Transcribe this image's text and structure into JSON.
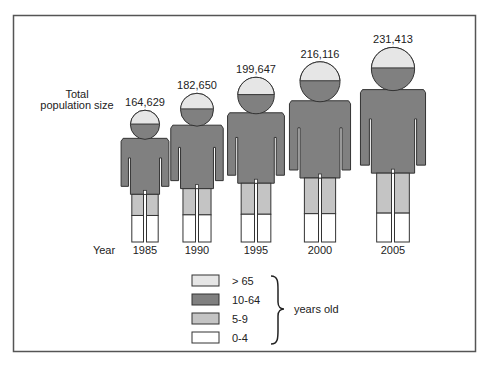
{
  "chart_data": {
    "type": "pictogram",
    "title": "",
    "population_label_line1": "Total",
    "population_label_line2": "population size",
    "year_label": "Year",
    "categories": [
      "1985",
      "1990",
      "1995",
      "2000",
      "2005"
    ],
    "totals": [
      164629,
      182650,
      199647,
      216116,
      231413
    ],
    "total_labels": [
      "164,629",
      "182,650",
      "199,647",
      "216,116",
      "231,413"
    ],
    "age_groups": [
      {
        "name": "> 65",
        "color": "#e6e6e6"
      },
      {
        "name": "10-64",
        "color": "#808080"
      },
      {
        "name": "5-9",
        "color": "#c4c4c4"
      },
      {
        "name": "0-4",
        "color": "#ffffff"
      }
    ],
    "legend_suffix": "years old",
    "legend_placement": "bottom-center"
  }
}
